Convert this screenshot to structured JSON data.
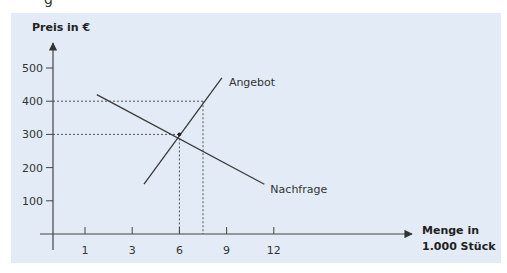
{
  "header_fragment": "g",
  "chart_data": {
    "type": "line",
    "title": "",
    "ylabel": "Preis in €",
    "xlabel_lines": [
      "Menge in",
      "1.000 Stück"
    ],
    "y_ticks": [
      100,
      200,
      300,
      400,
      500
    ],
    "ylim": [
      0,
      500
    ],
    "x_ticks": [
      "1",
      "3",
      "6",
      "9",
      "12"
    ],
    "x_tick_positions": [
      1,
      2,
      3,
      4,
      5
    ],
    "xlim": [
      0,
      5.4
    ],
    "grid": false,
    "series": [
      {
        "name": "Angebot",
        "points": [
          [
            2.25,
            150
          ],
          [
            3.9,
            470
          ]
        ]
      },
      {
        "name": "Nachfrage",
        "points": [
          [
            1.25,
            420
          ],
          [
            4.8,
            150
          ]
        ]
      }
    ],
    "equilibrium": {
      "x_label": "6",
      "x_pos": 3,
      "y": 300
    },
    "reference_lines": [
      {
        "x_pos": 3,
        "y": 300,
        "style": "dotted"
      },
      {
        "x_pos": 3.5,
        "y": 400,
        "style": "dotted"
      }
    ],
    "annotations": [
      {
        "text": "Angebot",
        "series": "Angebot"
      },
      {
        "text": "Nachfrage",
        "series": "Nachfrage"
      }
    ]
  }
}
